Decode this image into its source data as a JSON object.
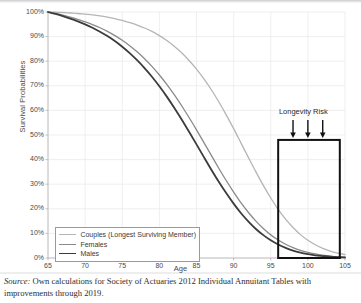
{
  "figure": {
    "background_color": "#ffffff",
    "plot_background_color": "#ffffff",
    "grid_color": "#e8e8e8",
    "axis_color": "#b9b9b9"
  },
  "axis_titles": {
    "y": "Survival Probabilities",
    "x": "Age"
  },
  "annotation": {
    "label": "Longevity Risk",
    "arrow_ages": [
      98,
      100,
      102
    ],
    "arrow_icon": "down-arrow-icon",
    "highlight_box": {
      "x_start": 96,
      "x_end": 104.3,
      "y_start": 0,
      "y_end": 48,
      "border_color": "#111111",
      "border_width_px": 2
    }
  },
  "legend": {
    "position": "bottom-left-inside",
    "entries": [
      {
        "label": "Couples (Longest Surviving Member)",
        "color": "#b5b5b5",
        "width_px": 1.3
      },
      {
        "label": "Females",
        "color": "#8a8a8a",
        "width_px": 1.3
      },
      {
        "label": "Males",
        "color": "#3c3c3c",
        "width_px": 1.8
      }
    ]
  },
  "caption": {
    "source_word": "Source:",
    "text": " Own calculations for Society of Actuaries 2012 Individual Annuitant Tables with improvements through 2019."
  },
  "chart_data": {
    "type": "line",
    "title": "",
    "xlabel": "Age",
    "ylabel": "Survival Probabilities",
    "xlim": [
      65,
      105
    ],
    "ylim": [
      0,
      100
    ],
    "xticks": [
      65,
      70,
      75,
      80,
      85,
      90,
      95,
      100,
      105
    ],
    "yticks": [
      0,
      10,
      20,
      30,
      40,
      50,
      60,
      70,
      80,
      90,
      100
    ],
    "ytick_labels": [
      "0%",
      "10%",
      "20%",
      "30%",
      "40%",
      "50%",
      "60%",
      "70%",
      "80%",
      "90%",
      "100%"
    ],
    "xtick_labels": [
      "65",
      "70",
      "75",
      "80",
      "85",
      "90",
      "95",
      "100",
      "105"
    ],
    "grid": true,
    "legend_position": "lower left",
    "x": [
      65,
      66,
      67,
      68,
      69,
      70,
      71,
      72,
      73,
      74,
      75,
      76,
      77,
      78,
      79,
      80,
      81,
      82,
      83,
      84,
      85,
      86,
      87,
      88,
      89,
      90,
      91,
      92,
      93,
      94,
      95,
      96,
      97,
      98,
      99,
      100,
      101,
      102,
      103,
      104,
      105
    ],
    "series": [
      {
        "name": "Couples (Longest Surviving Member)",
        "color": "#b5b5b5",
        "values": [
          100,
          99.9,
          99.8,
          99.6,
          99.4,
          99.1,
          98.8,
          98.4,
          97.9,
          97.3,
          96.6,
          95.7,
          94.7,
          93.5,
          92.1,
          90.4,
          88.4,
          86.1,
          83.4,
          80.3,
          76.8,
          72.8,
          68.4,
          63.5,
          58.2,
          52.6,
          46.7,
          40.8,
          35.0,
          29.5,
          24.4,
          19.8,
          15.8,
          12.4,
          9.5,
          7.2,
          5.4,
          3.9,
          2.8,
          2.0,
          1.4
        ]
      },
      {
        "name": "Females",
        "color": "#8a8a8a",
        "values": [
          100,
          99.4,
          98.7,
          97.9,
          97.0,
          96.0,
          94.9,
          93.6,
          92.1,
          90.4,
          88.5,
          86.3,
          83.8,
          81.0,
          77.9,
          74.4,
          70.6,
          66.4,
          61.9,
          57.1,
          52.1,
          46.9,
          41.7,
          36.5,
          31.5,
          26.8,
          22.4,
          18.5,
          15.0,
          12.0,
          9.4,
          7.3,
          5.6,
          4.2,
          3.1,
          2.3,
          1.7,
          1.2,
          0.8,
          0.5,
          0.3
        ]
      },
      {
        "name": "Males",
        "color": "#3c3c3c",
        "values": [
          100,
          99.2,
          98.3,
          97.3,
          96.2,
          95.0,
          93.6,
          92.0,
          90.2,
          88.2,
          85.9,
          83.3,
          80.4,
          77.2,
          73.7,
          69.8,
          65.6,
          61.1,
          56.3,
          51.3,
          46.2,
          41.0,
          35.9,
          31.0,
          26.4,
          22.1,
          18.2,
          14.8,
          11.8,
          9.3,
          7.2,
          5.5,
          4.1,
          3.0,
          2.2,
          1.6,
          1.1,
          0.8,
          0.5,
          0.3,
          0.2
        ]
      }
    ]
  }
}
